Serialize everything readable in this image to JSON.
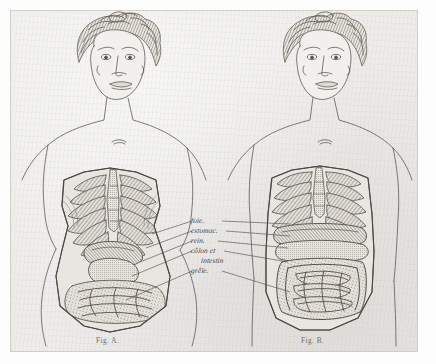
{
  "plate": {
    "kind": "anatomical-engraving",
    "paper_color": "#edecea",
    "ink_color": "#55524d",
    "margin_color": "#fdfdfd"
  },
  "figures": [
    {
      "id": "A",
      "caption": "Fig. A.",
      "description": "corseted torso with compressed ribcage and displaced organs"
    },
    {
      "id": "B",
      "caption": "Fig. B.",
      "description": "natural torso with normal ribcage and organ placement"
    }
  ],
  "labels": [
    {
      "id": "foie",
      "text": "foie."
    },
    {
      "id": "estomac",
      "text": "estomac."
    },
    {
      "id": "rein",
      "text": "rein."
    },
    {
      "id": "colon",
      "text": "côlon et"
    },
    {
      "id": "intestin",
      "text": "intestin"
    },
    {
      "id": "grele",
      "text": "grêle."
    }
  ]
}
